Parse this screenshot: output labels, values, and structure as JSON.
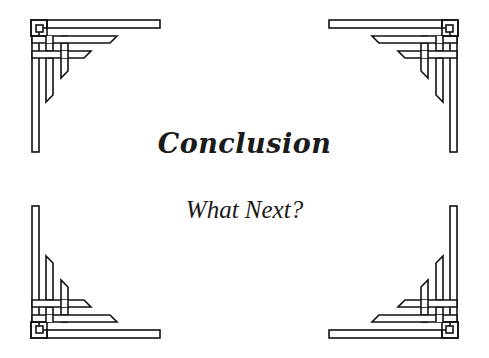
{
  "slide": {
    "title": "Conclusion",
    "subtitle": "What Next?",
    "background_color": "#ffffff",
    "text_color": "#1a1a1a",
    "ornament_color": "#111111",
    "ornaments": [
      {
        "position": "top-left",
        "icon": "celtic-knot-corner-icon"
      },
      {
        "position": "top-right",
        "icon": "celtic-knot-corner-icon"
      },
      {
        "position": "bottom-left",
        "icon": "celtic-knot-corner-icon"
      },
      {
        "position": "bottom-right",
        "icon": "celtic-knot-corner-icon"
      }
    ]
  }
}
